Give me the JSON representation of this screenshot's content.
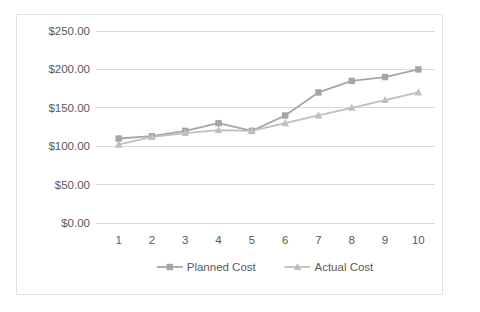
{
  "chart_data": {
    "type": "line",
    "title": "",
    "subtitle": "",
    "xlabel": "",
    "ylabel": "",
    "categories": [
      "1",
      "2",
      "3",
      "4",
      "5",
      "6",
      "7",
      "8",
      "9",
      "10"
    ],
    "x": [
      1,
      2,
      3,
      4,
      5,
      6,
      7,
      8,
      9,
      10
    ],
    "series": [
      {
        "name": "Planned Cost",
        "marker": "square",
        "color": "#a6a6a6",
        "values": [
          110,
          113,
          120,
          130,
          120,
          140,
          170,
          185,
          190,
          200
        ]
      },
      {
        "name": "Actual Cost",
        "marker": "triangle",
        "color": "#bfbfbf",
        "values": [
          102,
          112,
          117,
          121,
          120,
          130,
          140,
          150,
          160,
          170
        ]
      }
    ],
    "ylim": [
      0,
      250
    ],
    "ytick_values": [
      0,
      50,
      100,
      150,
      200,
      250
    ],
    "ytick_labels": [
      "$0.00",
      "$50.00",
      "$100.00",
      "$150.00",
      "$200.00",
      "$250.00"
    ],
    "xtick_labels": [
      "1",
      "2",
      "3",
      "4",
      "5",
      "6",
      "7",
      "8",
      "9",
      "10"
    ],
    "grid": true,
    "grid_axis": "y",
    "legend": true,
    "legend_position": "bottom",
    "legend_entries": [
      "Planned Cost",
      "Actual Cost"
    ],
    "plot_background": "#ffffff",
    "border_color": "#e0e0e0",
    "gridline_color": "#d9d9d9",
    "text_color": "#595959"
  }
}
